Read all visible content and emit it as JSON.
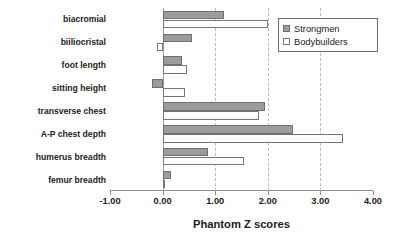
{
  "chart_data": {
    "type": "bar",
    "orientation": "horizontal",
    "title": "",
    "xlabel": "Phantom Z scores",
    "ylabel": "",
    "xlim": [
      -1.0,
      4.0
    ],
    "xticks": [
      -1.0,
      0.0,
      1.0,
      2.0,
      3.0,
      4.0
    ],
    "xticklabels": [
      "-1.00",
      "0.00",
      "1.00",
      "2.00",
      "3.00",
      "4.00"
    ],
    "grid": "vertical-dashed-at-1-2-3",
    "legend_position": "upper-right",
    "categories": [
      "biacromial",
      "biiliocristal",
      "foot length",
      "sitting height",
      "transverse chest",
      "A-P chest depth",
      "humerus breadth",
      "femur breadth"
    ],
    "series": [
      {
        "name": "Strongmen",
        "color": "#9c9c9c",
        "values": [
          1.17,
          0.55,
          0.36,
          -0.21,
          1.95,
          2.48,
          0.87,
          0.16
        ]
      },
      {
        "name": "Bodybuilders",
        "color": "#ffffff",
        "values": [
          2.0,
          -0.1,
          0.46,
          0.42,
          1.83,
          3.43,
          1.54,
          0.02
        ]
      }
    ]
  },
  "legend": {
    "entries": [
      {
        "label": "Strongmen",
        "swatch": "filled-gray-square-icon"
      },
      {
        "label": "Bodybuilders",
        "swatch": "open-white-square-icon"
      }
    ]
  }
}
